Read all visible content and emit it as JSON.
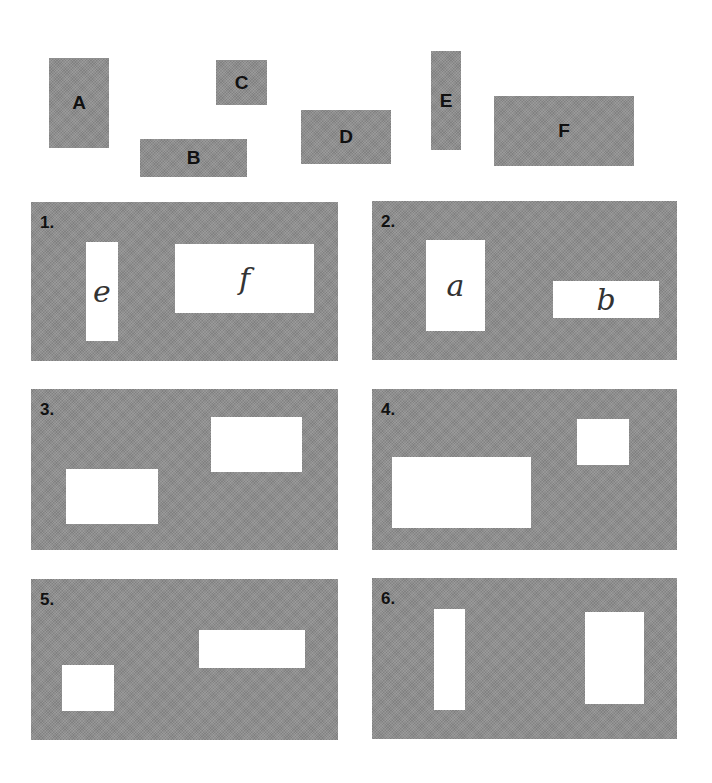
{
  "pieces": [
    {
      "label": "A",
      "x": 49,
      "y": 58,
      "w": 60,
      "h": 90
    },
    {
      "label": "B",
      "x": 140,
      "y": 139,
      "w": 107,
      "h": 38
    },
    {
      "label": "C",
      "x": 216,
      "y": 60,
      "w": 51,
      "h": 45
    },
    {
      "label": "D",
      "x": 301,
      "y": 110,
      "w": 90,
      "h": 54
    },
    {
      "label": "E",
      "x": 431,
      "y": 51,
      "w": 30,
      "h": 99
    },
    {
      "label": "F",
      "x": 494,
      "y": 96,
      "w": 140,
      "h": 70
    }
  ],
  "panels": [
    {
      "number": "1.",
      "x": 31,
      "y": 202,
      "w": 307,
      "h": 159,
      "holes": [
        {
          "label": "e",
          "x": 55,
          "y": 40,
          "w": 32,
          "h": 99
        },
        {
          "label": "f",
          "x": 144,
          "y": 42,
          "w": 139,
          "h": 69
        }
      ]
    },
    {
      "number": "2.",
      "x": 372,
      "y": 201,
      "w": 305,
      "h": 159,
      "holes": [
        {
          "label": "a",
          "x": 54,
          "y": 39,
          "w": 59,
          "h": 91
        },
        {
          "label": "b",
          "x": 181,
          "y": 80,
          "w": 106,
          "h": 37
        }
      ]
    },
    {
      "number": "3.",
      "x": 31,
      "y": 389,
      "w": 307,
      "h": 161,
      "holes": [
        {
          "label": "",
          "x": 35,
          "y": 80,
          "w": 92,
          "h": 55
        },
        {
          "label": "",
          "x": 180,
          "y": 28,
          "w": 91,
          "h": 55
        }
      ]
    },
    {
      "number": "4.",
      "x": 372,
      "y": 389,
      "w": 305,
      "h": 161,
      "holes": [
        {
          "label": "",
          "x": 20,
          "y": 68,
          "w": 139,
          "h": 71
        },
        {
          "label": "",
          "x": 205,
          "y": 30,
          "w": 52,
          "h": 46
        }
      ]
    },
    {
      "number": "5.",
      "x": 31,
      "y": 579,
      "w": 307,
      "h": 161,
      "holes": [
        {
          "label": "",
          "x": 31,
          "y": 86,
          "w": 52,
          "h": 46
        },
        {
          "label": "",
          "x": 168,
          "y": 51,
          "w": 106,
          "h": 38
        }
      ]
    },
    {
      "number": "6.",
      "x": 372,
      "y": 578,
      "w": 305,
      "h": 161,
      "holes": [
        {
          "label": "",
          "x": 62,
          "y": 31,
          "w": 31,
          "h": 101
        },
        {
          "label": "",
          "x": 213,
          "y": 34,
          "w": 59,
          "h": 92
        }
      ]
    }
  ]
}
